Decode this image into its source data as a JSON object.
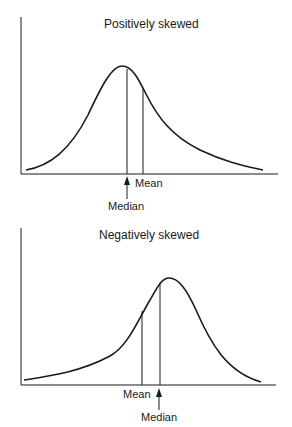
{
  "top": {
    "title": "Positively skewed",
    "mean_label": "Mean",
    "median_label": "Median"
  },
  "bottom": {
    "title": "Negatively skewed",
    "mean_label": "Mean",
    "median_label": "Median"
  },
  "colors": {
    "ink": "#1a1a1a",
    "background": "#ffffff"
  }
}
